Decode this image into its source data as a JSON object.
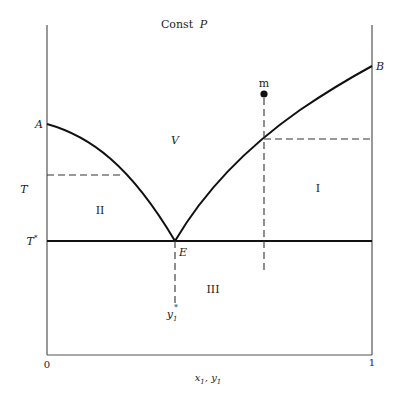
{
  "diagram": {
    "title": "Const",
    "title_var": "P",
    "axis": {
      "x_label_a": "x",
      "x_label_a_sub": "1",
      "x_label_sep": ", ",
      "x_label_b": "y",
      "x_label_b_sub": "1",
      "y_label": "T",
      "x_tick_left": "0",
      "x_tick_right": "1",
      "t_star_label": "T",
      "t_star_sup": "*"
    },
    "points": {
      "A": "A",
      "B": "B",
      "E": "E",
      "m": "m"
    },
    "regions": {
      "V": "V",
      "I": "I",
      "II": "II",
      "III": "III"
    },
    "eutectic_composition": {
      "label": "y",
      "sub": "1",
      "sup": "*"
    },
    "colors": {
      "line": "#111111",
      "axis": "#555555",
      "dash": "#333333"
    }
  }
}
